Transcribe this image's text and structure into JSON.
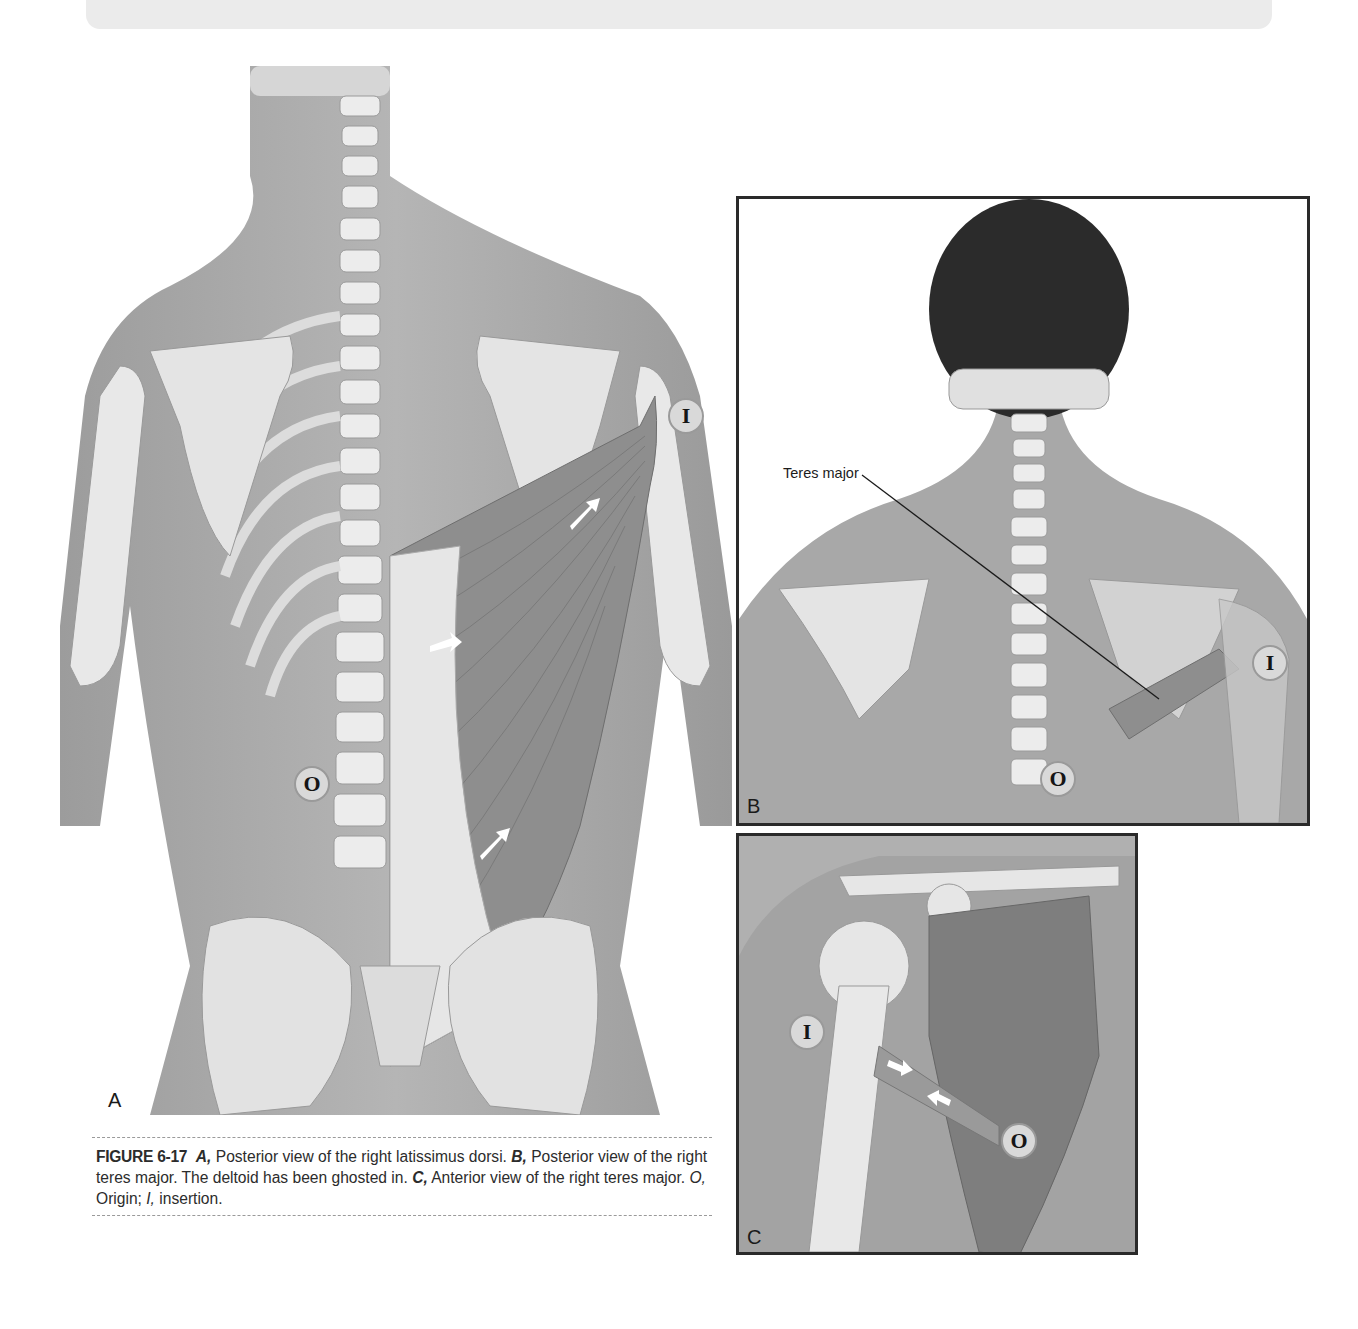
{
  "figure": {
    "number": "FIGURE 6-17",
    "caption_parts": {
      "a_letter": "A,",
      "a_text": " Posterior view of the right latissimus dorsi. ",
      "b_letter": "B,",
      "b_text": " Posterior view of the right teres major. The deltoid has been ghosted in. ",
      "c_letter": "C,",
      "c_text": " Anterior view of the right teres major. ",
      "o_abbr": "O,",
      "o_text": " Origin; ",
      "i_abbr": "I,",
      "i_text": " insertion."
    }
  },
  "panels": {
    "a": {
      "letter": "A",
      "title": "Posterior view of the right latissimus dorsi",
      "markers": {
        "origin": "O",
        "insertion": "I"
      }
    },
    "b": {
      "letter": "B",
      "title": "Posterior view of the right teres major",
      "leader_label": "Teres major",
      "markers": {
        "origin": "O",
        "insertion": "I"
      }
    },
    "c": {
      "letter": "C",
      "title": "Anterior view of the right teres major",
      "markers": {
        "origin": "O",
        "insertion": "I"
      }
    }
  },
  "colors": {
    "muscle": "#8a8a8a",
    "bone": "#ececec",
    "skin": "#a9a9a9",
    "background": "#ffffff",
    "border": "#2a2a2a"
  }
}
